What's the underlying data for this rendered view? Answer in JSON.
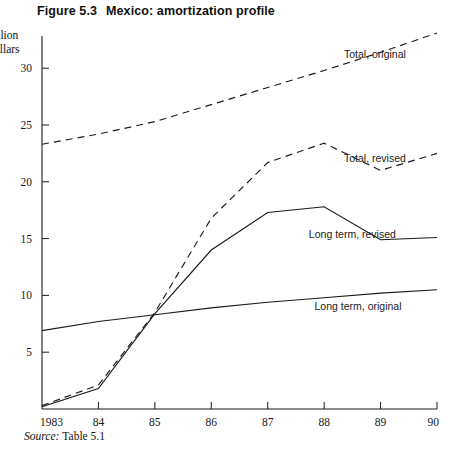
{
  "figure": {
    "number": "Figure 5.3",
    "title": "Mexico: amortization profile",
    "axis_unit_line1": "illion",
    "axis_unit_line2": "ollars",
    "source_label": "Source:",
    "source_value": "Table 5.1"
  },
  "chart_data": {
    "type": "line",
    "title": "Mexico: amortization profile",
    "xlabel": "",
    "ylabel": "Billion dollars",
    "categories": [
      "1983",
      "84",
      "85",
      "86",
      "87",
      "88",
      "89",
      "90"
    ],
    "x_tick_labels": [
      "1983",
      "84",
      "85",
      "86",
      "87",
      "88",
      "89",
      "90"
    ],
    "y_tick_labels": [
      "5",
      "10",
      "15",
      "20",
      "25",
      "30"
    ],
    "y_ticks": [
      5,
      10,
      15,
      20,
      25,
      30
    ],
    "ylim": [
      0,
      32.8
    ],
    "xlim": [
      1983,
      1990
    ],
    "grid": false,
    "legend": "inline-labels",
    "series": [
      {
        "name": "Total, original",
        "style": "dashed",
        "label_position": "right-upper",
        "values": [
          23.3,
          24.2,
          25.3,
          26.8,
          28.3,
          29.8,
          31.4,
          33.1
        ]
      },
      {
        "name": "Total, revised",
        "style": "dashed",
        "label_position": "right-middle",
        "values": [
          0.3,
          2.1,
          8.5,
          16.8,
          21.7,
          23.4,
          21.0,
          22.5
        ]
      },
      {
        "name": "Long term, revised",
        "style": "solid",
        "label_position": "right-lower",
        "values": [
          0.2,
          1.8,
          8.4,
          14.0,
          17.3,
          17.8,
          14.9,
          15.1
        ]
      },
      {
        "name": "Long term, original",
        "style": "solid",
        "label_position": "right-bottom",
        "values": [
          6.9,
          7.7,
          8.3,
          8.9,
          9.4,
          9.8,
          10.2,
          10.5
        ]
      }
    ]
  },
  "series_labels": {
    "total_original": "Total, original",
    "total_revised": "Total, revised",
    "long_term_revised": "Long term, revised",
    "long_term_original": "Long term, original"
  }
}
